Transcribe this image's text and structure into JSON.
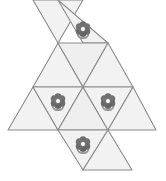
{
  "figure": {
    "canvas": {
      "width": 166,
      "height": 181,
      "background": "#ffffff"
    },
    "style": {
      "face_fill": "#f2f2f2",
      "face_fill_alt": "#efefef",
      "edge_color": "#8c8c8c",
      "edge_width": 1.1,
      "flower_petal": "#6e6e6e",
      "flower_petal_dark": "#5a5a5a",
      "flower_center": "#ffffff",
      "flower_center_ring": "#8a8a8a",
      "leaf_color": "#9a9a9a",
      "stem_color": "#7d7d7d"
    },
    "grid": {
      "columns_x": [
        8,
        33,
        58,
        83,
        108,
        133,
        156
      ],
      "rows_y": [
        0,
        43,
        87,
        130,
        170
      ],
      "triangle_side": 50,
      "triangle_height": 43
    },
    "counts": {
      "total_faces": 12,
      "faces_with_flower": 4,
      "empty_faces": 8
    },
    "faces": [
      {
        "id": "face-r1-down",
        "name": "triangle-top-left",
        "row": 1,
        "orientation": "down",
        "points": "33,0 83,0 58,43",
        "flower": false,
        "fill": "#f2f2f2"
      },
      {
        "id": "face-r1-up",
        "name": "triangle-top-right",
        "row": 1,
        "orientation": "up",
        "points": "83,43 58,0 108,43",
        "flower": true,
        "fill": "#f2f2f2",
        "flower_cx": 83,
        "flower_cy": 29
      },
      {
        "id": "face-r2-up-a",
        "name": "triangle-row2-left",
        "row": 2,
        "orientation": "up",
        "points": "33,87 58,43 83,87",
        "flower": false,
        "fill": "#f2f2f2"
      },
      {
        "id": "face-r2-down",
        "name": "triangle-row2-middle",
        "row": 2,
        "orientation": "down",
        "points": "58,43 108,43 83,87",
        "flower": false,
        "fill": "#efefef"
      },
      {
        "id": "face-r2-up-b",
        "name": "triangle-row2-right",
        "row": 2,
        "orientation": "up",
        "points": "83,87 108,43 133,87",
        "flower": false,
        "fill": "#f2f2f2"
      },
      {
        "id": "face-r3-up-a",
        "name": "triangle-row3-far-left",
        "row": 3,
        "orientation": "up",
        "points": "8,130 33,87 58,130",
        "flower": false,
        "fill": "#f2f2f2"
      },
      {
        "id": "face-r3-down-a",
        "name": "triangle-row3-left",
        "row": 3,
        "orientation": "down",
        "points": "33,87 83,87 58,130",
        "flower": true,
        "fill": "#f2f2f2",
        "flower_cx": 58,
        "flower_cy": 101
      },
      {
        "id": "face-r3-up-b",
        "name": "triangle-row3-middle",
        "row": 3,
        "orientation": "up",
        "points": "58,130 83,87 108,130",
        "flower": false,
        "fill": "#efefef"
      },
      {
        "id": "face-r3-down-b",
        "name": "triangle-row3-right",
        "row": 3,
        "orientation": "down",
        "points": "83,87 133,87 108,130",
        "flower": true,
        "fill": "#f2f2f2",
        "flower_cx": 108,
        "flower_cy": 101
      },
      {
        "id": "face-r3-up-c",
        "name": "triangle-row3-far-right",
        "row": 3,
        "orientation": "up",
        "points": "108,130 133,87 156,130",
        "flower": false,
        "fill": "#f2f2f2"
      },
      {
        "id": "face-r4-down",
        "name": "triangle-bottom-left",
        "row": 4,
        "orientation": "down",
        "points": "58,130 108,130 83,170",
        "flower": true,
        "fill": "#f2f2f2",
        "flower_cx": 83,
        "flower_cy": 144
      },
      {
        "id": "face-r4-up",
        "name": "triangle-bottom-right",
        "row": 4,
        "orientation": "up",
        "points": "83,170 108,130 132,170",
        "flower": false,
        "fill": "#f2f2f2"
      }
    ],
    "flower_icon": {
      "name": "flower-icon",
      "petal_count": 6,
      "petal_radius": 3.6,
      "petal_orbit": 4.3,
      "center_radius": 2.0,
      "stem_length": 7,
      "leaf_span": 10
    }
  }
}
